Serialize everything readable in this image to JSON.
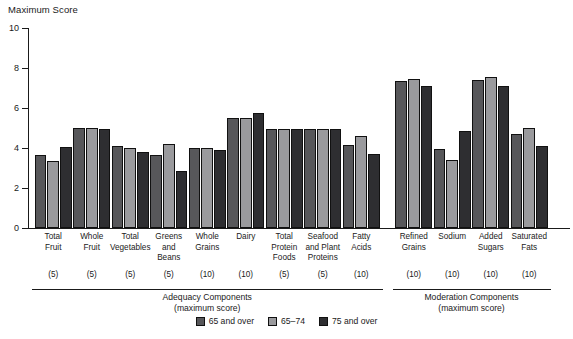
{
  "chart_data": {
    "type": "bar",
    "title": "",
    "ylabel": "Maximum Score",
    "xlabel": "",
    "ylim": [
      0,
      10
    ],
    "yticks": [
      0,
      2,
      4,
      6,
      8,
      10
    ],
    "ytick_labels": [
      "0",
      "2",
      "4",
      "6",
      "8",
      "10"
    ],
    "grid": false,
    "legend_position": "bottom-center",
    "categories": [
      "Total Fruit",
      "Whole Fruit",
      "Total Vegetables",
      "Greens and Beans",
      "Whole Grains",
      "Dairy",
      "Total Protein Foods",
      "Seafood and Plant Proteins",
      "Fatty Acids",
      "Refined Grains",
      "Sodium",
      "Added Sugars",
      "Saturated Fats"
    ],
    "category_labels": [
      "Total\nFruit",
      "Whole\nFruit",
      "Total\nVegetables",
      "Greens\nand\nBeans",
      "Whole\nGrains",
      "Dairy",
      "Total\nProtein\nFoods",
      "Seafood\nand Plant\nProteins",
      "Fatty\nAcids",
      "Refined\nGrains",
      "Sodium",
      "Added\nSugars",
      "Saturated\nFats"
    ],
    "max_scores": [
      "(5)",
      "(5)",
      "(5)",
      "(5)",
      "(10)",
      "(10)",
      "(5)",
      "(5)",
      "(10)",
      "(10)",
      "(10)",
      "(10)",
      "(10)"
    ],
    "series": [
      {
        "name": "65 and over",
        "color": "#57575a",
        "values": [
          3.65,
          5.0,
          4.1,
          3.65,
          4.0,
          5.5,
          4.95,
          4.95,
          4.15,
          7.35,
          3.95,
          7.4,
          4.7
        ]
      },
      {
        "name": "65–74",
        "color": "#9a9a9d",
        "values": [
          3.35,
          5.0,
          4.0,
          4.2,
          4.0,
          5.5,
          4.95,
          4.95,
          4.6,
          7.45,
          3.4,
          7.55,
          5.0
        ]
      },
      {
        "name": "75 and over",
        "color": "#2e2e31",
        "values": [
          4.05,
          4.95,
          3.8,
          2.85,
          3.9,
          5.75,
          4.95,
          4.95,
          3.7,
          7.1,
          4.85,
          7.1,
          4.1
        ]
      }
    ],
    "sections": [
      {
        "label": "Adequacy Components\n(maximum score)",
        "start_index": 0,
        "end_index": 8
      },
      {
        "label": "Moderation Components\n(maximum score)",
        "start_index": 9,
        "end_index": 12
      }
    ]
  }
}
